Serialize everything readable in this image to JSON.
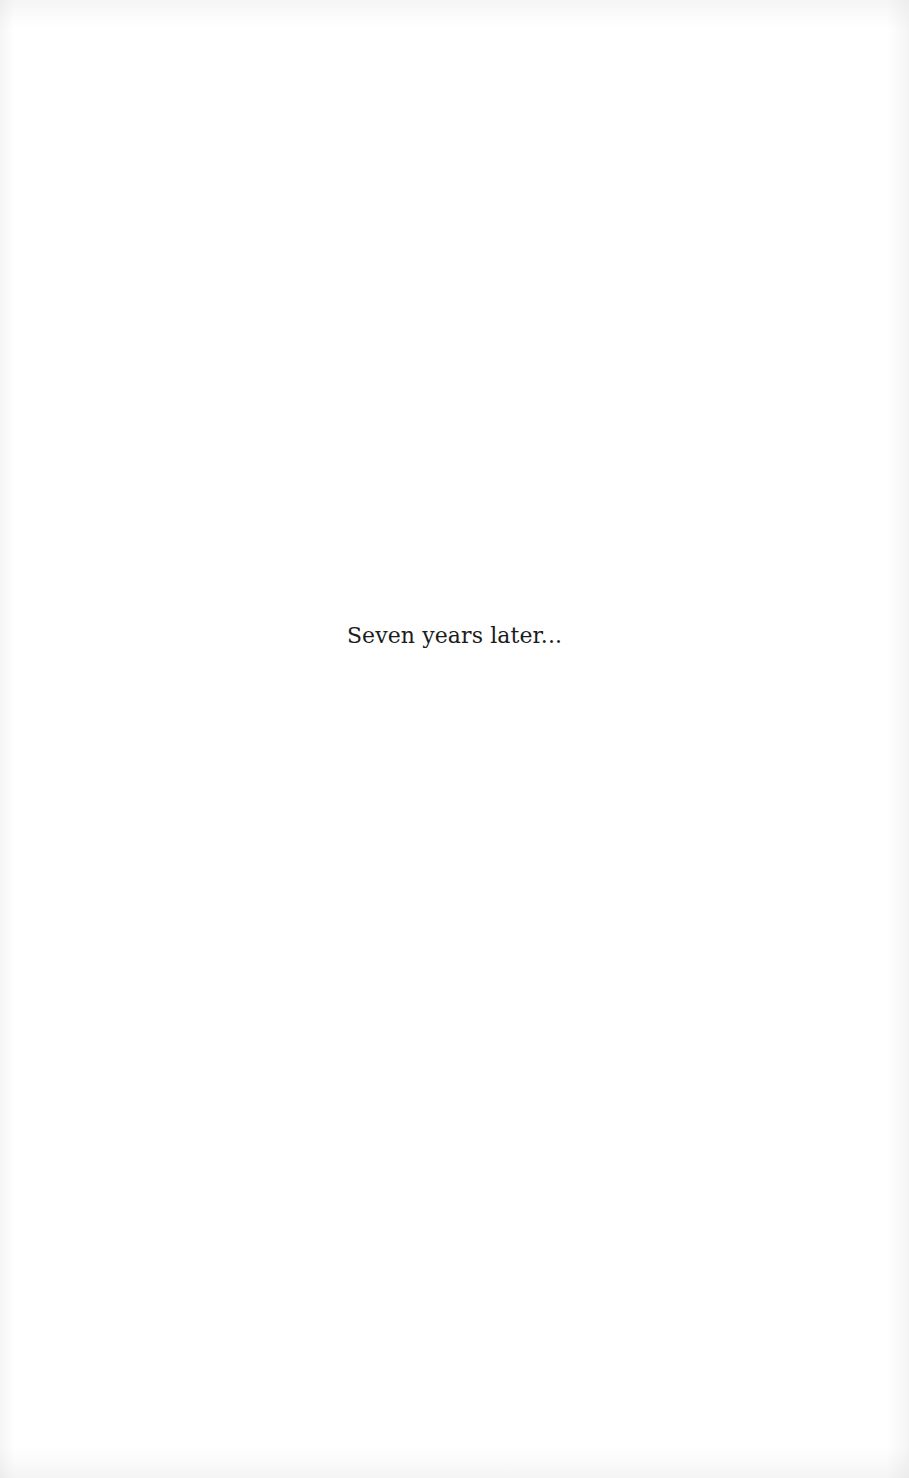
{
  "page": {
    "background_color": "#ffffff",
    "text_color": "#1c1c1c",
    "content": {
      "line": "Seven years later..."
    }
  }
}
